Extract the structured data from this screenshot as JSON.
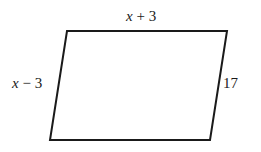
{
  "diagram": {
    "shape": "parallelogram",
    "vertices": {
      "top_left": [
        67,
        31
      ],
      "top_right": [
        227,
        31
      ],
      "bottom_right": [
        210,
        140
      ],
      "bottom_left": [
        50,
        140
      ]
    },
    "stroke_color": "#1a1a1a",
    "labels": {
      "top": {
        "var": "x",
        "op": " + ",
        "num": "3"
      },
      "left": {
        "var": "x",
        "op": " − ",
        "num": "3"
      },
      "right": {
        "text": "17"
      }
    }
  }
}
